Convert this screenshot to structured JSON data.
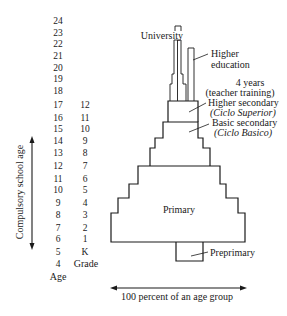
{
  "diagram": {
    "ages": [
      "24",
      "23",
      "22",
      "21",
      "20",
      "19",
      "18",
      "17",
      "16",
      "15",
      "14",
      "13",
      "12",
      "11",
      "10",
      "9",
      "8",
      "7",
      "6",
      "5",
      "4"
    ],
    "age_label": "Age",
    "grades": [
      "12",
      "11",
      "10",
      "9",
      "8",
      "7",
      "6",
      "5",
      "4",
      "3",
      "2",
      "1",
      "K"
    ],
    "grade_label": "Grade",
    "compulsory_label": "Compulsory school age",
    "width_label": "100 percent of an age group",
    "levels": {
      "university": "University",
      "higher_education_1": "Higher",
      "higher_education_2": "education",
      "teacher_training_1": "4 years",
      "teacher_training_2": "(teacher training)",
      "higher_secondary": "Higher secondary",
      "higher_secondary_alt": "(Ciclo Superior)",
      "basic_secondary": "Basic secondary",
      "basic_secondary_alt": "(Ciclo Basico)",
      "primary": "Primary",
      "preprimary": "Preprimary"
    },
    "shapes": {
      "primary": "111,242 111,213 118,213 118,198 129,198 129,184 138,184 138,166 220,166 220,184 226,184 226,198 238,198 238,213 245,213 245,242",
      "basic_secondary": "150,166 150,148 155,148 155,138 163,138 163,122 198,122 198,138 203,138 203,148 210,148 210,166",
      "higher_secondary": "168,122 168,101 198,101 198,122",
      "university": "170,101 170,84 172,84 172,74 174,74 174,40 181,40 181,74 183,74 183,84 186,84 186,101",
      "university_cap": "175,31 175,26 181,26 181,31",
      "teacher_training": "188,101 188,48 194,48 194,101",
      "preprimary": "176,242 176,261 203,261 203,242"
    },
    "colors": {
      "ink": "#1a1a1a",
      "background": "#ffffff"
    }
  }
}
